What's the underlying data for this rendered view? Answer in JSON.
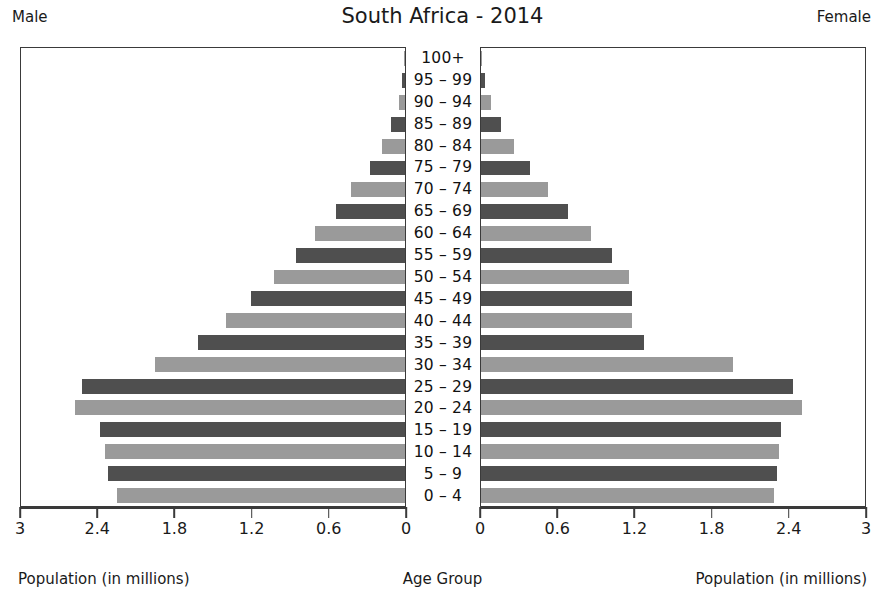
{
  "header": {
    "title": "South Africa - 2014",
    "left_label": "Male",
    "right_label": "Female"
  },
  "captions": {
    "left": "Population (in millions)",
    "center": "Age Group",
    "right": "Population (in millions)"
  },
  "axes": {
    "left_ticks": [
      "3",
      "2.4",
      "1.8",
      "1.2",
      "0.6",
      "0"
    ],
    "right_ticks": [
      "0",
      "0.6",
      "1.2",
      "1.8",
      "2.4",
      "3"
    ],
    "max": 3,
    "tick_values": [
      0,
      0.6,
      1.2,
      1.8,
      2.4,
      3
    ]
  },
  "colors": {
    "bar_dark": "#4f4f4f",
    "bar_light": "#9a9a9a",
    "axis": "#3a3a3a",
    "background": "#ffffff",
    "text": "#1a1a1a"
  },
  "chart_data": {
    "type": "bar",
    "title": "South Africa - 2014",
    "xlabel": "Population (in millions)",
    "ylabel": "Age Group",
    "xlim": [
      0,
      3
    ],
    "grid": false,
    "legend": "none",
    "orientation": "horizontal-diverging",
    "categories": [
      "100+",
      "95 – 99",
      "90 – 94",
      "85 – 89",
      "80 – 84",
      "75 – 79",
      "70 – 74",
      "65 – 69",
      "60 – 64",
      "55 – 59",
      "50 – 54",
      "45 – 49",
      "40 – 44",
      "35 – 39",
      "30 – 34",
      "25 – 29",
      "20 – 24",
      "15 – 19",
      "10 – 14",
      "5 – 9",
      "0 – 4"
    ],
    "series": [
      {
        "name": "Male",
        "side": "left",
        "values": [
          0.01,
          0.02,
          0.05,
          0.11,
          0.18,
          0.27,
          0.42,
          0.54,
          0.7,
          0.85,
          1.02,
          1.2,
          1.4,
          1.62,
          1.95,
          2.52,
          2.58,
          2.38,
          2.34,
          2.32,
          2.25
        ]
      },
      {
        "name": "Female",
        "side": "right",
        "values": [
          0.01,
          0.03,
          0.08,
          0.16,
          0.26,
          0.38,
          0.52,
          0.68,
          0.86,
          1.02,
          1.16,
          1.18,
          1.18,
          1.27,
          1.97,
          2.44,
          2.51,
          2.34,
          2.33,
          2.31,
          2.29
        ]
      }
    ]
  }
}
